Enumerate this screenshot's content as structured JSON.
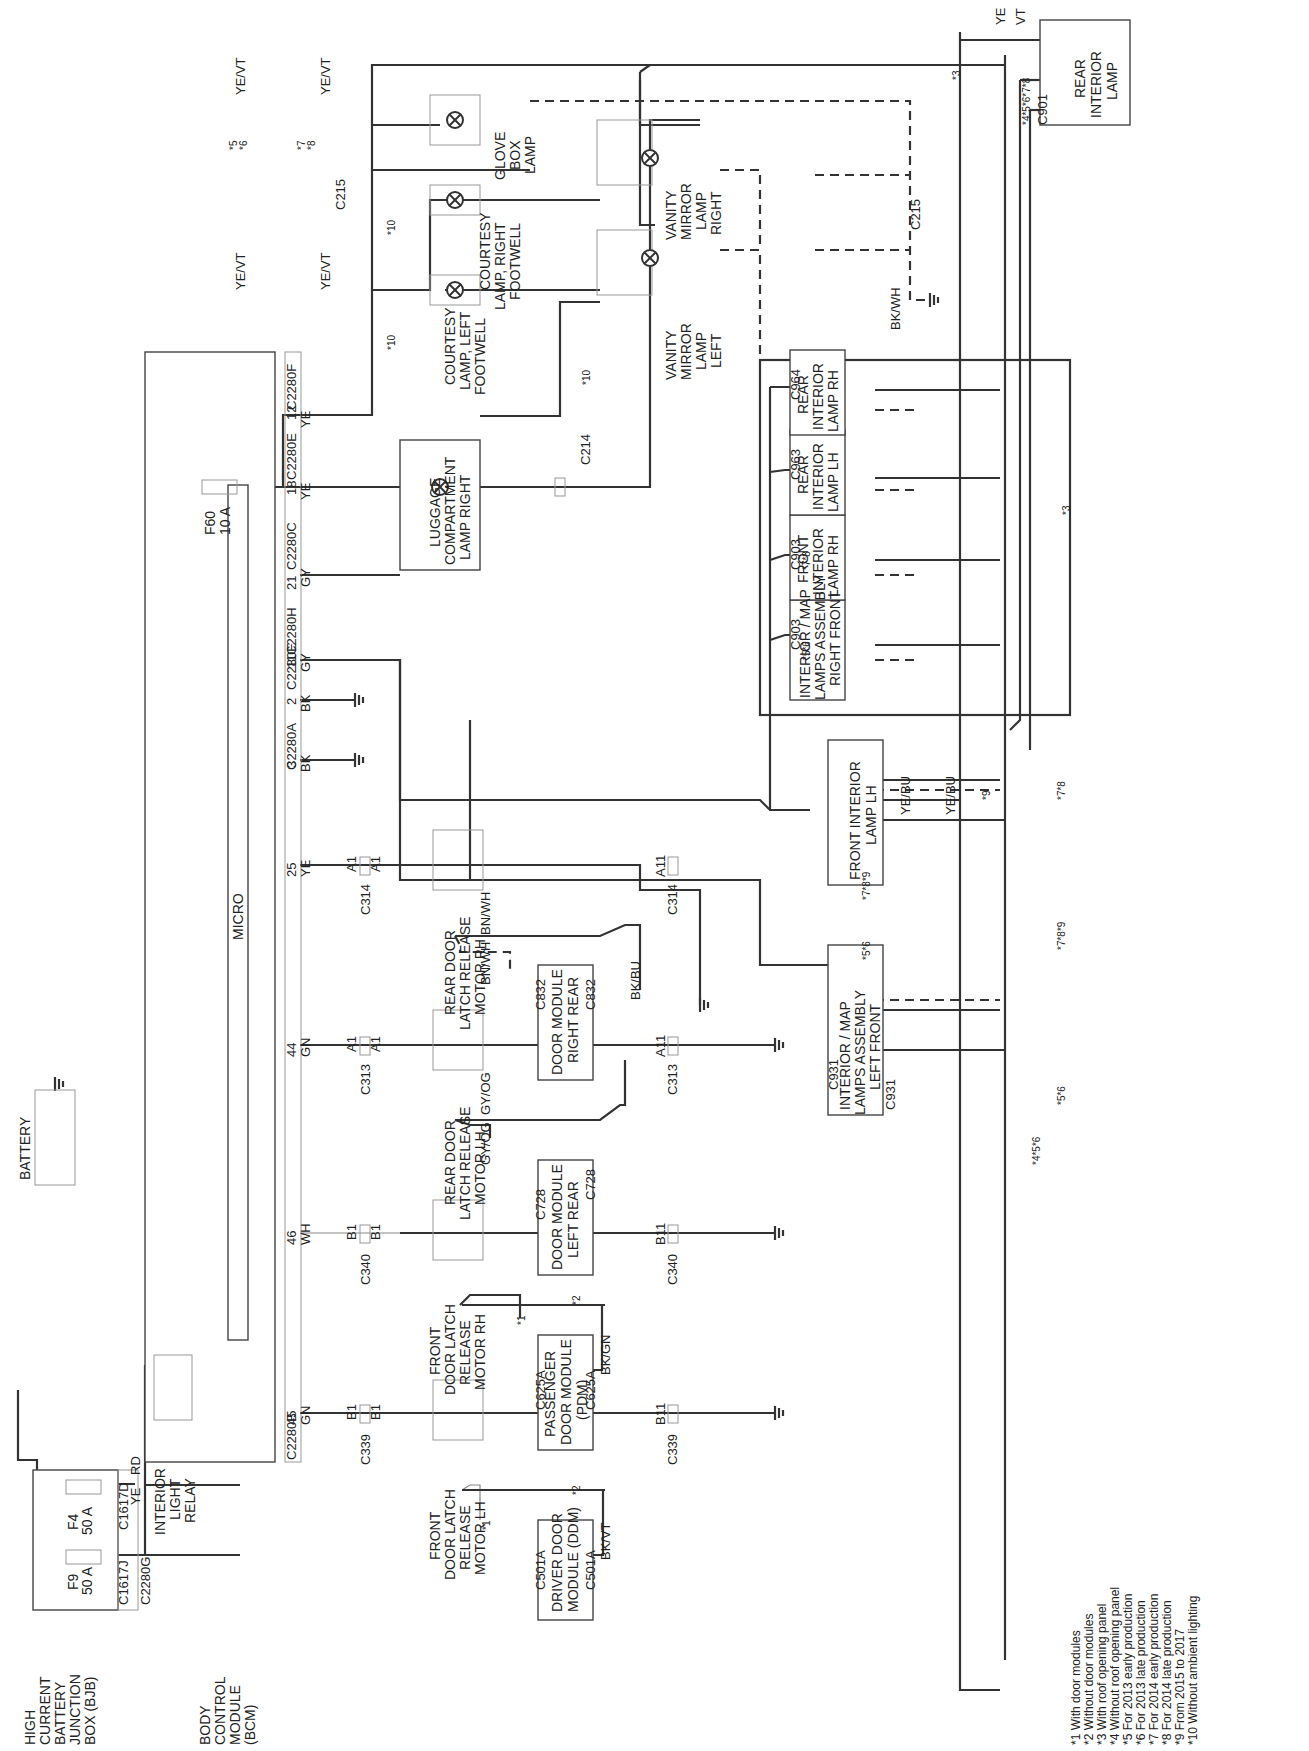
{
  "diagram": {
    "orientation": "rotated-90-ccw",
    "components": {
      "bjb": {
        "label": [
          "HIGH",
          "CURRENT",
          "BATTERY",
          "JUNCTION",
          "BOX (BJB)"
        ],
        "fuses": [
          {
            "id": "F9",
            "rating": "50 A",
            "connector": "C1617J",
            "pin": "1"
          },
          {
            "id": "F4",
            "rating": "50 A",
            "connector": "C1617D",
            "pin": "1"
          }
        ]
      },
      "battery": {
        "label": "BATTERY"
      },
      "bcm": {
        "label": [
          "BODY",
          "CONTROL",
          "MODULE",
          "(BCM)"
        ],
        "micro_label": "MICRO",
        "fuse": {
          "id": "F60",
          "rating": "10 A"
        }
      },
      "relay": {
        "label": [
          "INTERIOR",
          "LIGHT",
          "RELAY"
        ]
      },
      "front_latch_lh": {
        "label": [
          "FRONT",
          "DOOR LATCH",
          "RELEASE",
          "MOTOR LH"
        ]
      },
      "front_latch_rh": {
        "label": [
          "FRONT",
          "DOOR LATCH",
          "RELEASE",
          "MOTOR RH"
        ]
      },
      "rear_latch_lh": {
        "label": [
          "REAR DOOR",
          "LATCH RELEASE",
          "MOTOR LH"
        ]
      },
      "rear_latch_rh": {
        "label": [
          "REAR DOOR",
          "LATCH RELEASE",
          "MOTOR RH"
        ]
      },
      "ddm": {
        "label": [
          "DRIVER DOOR",
          "MODULE (DDM)"
        ]
      },
      "pdm": {
        "label": [
          "PASSENGER",
          "DOOR MODULE",
          "(PDM)"
        ]
      },
      "dm_left_rear": {
        "label": [
          "DOOR MODULE",
          "LEFT REAR"
        ]
      },
      "dm_right_rear": {
        "label": [
          "DOOR MODULE",
          "RIGHT REAR"
        ]
      },
      "luggage_lamp": {
        "label": [
          "LUGGAGE",
          "COMPARTMENT",
          "LAMP RIGHT"
        ]
      },
      "courtesy_left": {
        "label": [
          "COURTESY",
          "LAMP, LEFT",
          "FOOTWELL"
        ]
      },
      "courtesy_right": {
        "label": [
          "COURTESY",
          "LAMP, RIGHT",
          "FOOTWELL"
        ]
      },
      "glove_box": {
        "label": [
          "GLOVE",
          "BOX",
          "LAMP"
        ]
      },
      "vanity_left": {
        "label": [
          "VANITY",
          "MIRROR",
          "LAMP",
          "LEFT"
        ]
      },
      "vanity_right": {
        "label": [
          "VANITY",
          "MIRROR",
          "LAMP",
          "RIGHT"
        ]
      },
      "map_left_front": {
        "label": [
          "INTERIOR / MAP",
          "LAMPS ASSEMBLY",
          "LEFT FRONT"
        ]
      },
      "map_right_front": {
        "label": [
          "INTERIOR / MAP",
          "LAMPS ASSEMBLY",
          "RIGHT FRONT"
        ]
      },
      "front_int_lh": {
        "label": [
          "FRONT INTERIOR",
          "LAMP LH"
        ]
      },
      "front_int_rh": {
        "label": [
          "FRONT",
          "INTERIOR",
          "LAMP RH"
        ]
      },
      "rear_int_lh": {
        "label": [
          "REAR",
          "INTERIOR",
          "LAMP LH"
        ]
      },
      "rear_int_rh": {
        "label": [
          "REAR",
          "INTERIOR",
          "LAMP RH"
        ]
      },
      "rear_int": {
        "label": [
          "REAR",
          "INTERIOR",
          "LAMP"
        ]
      }
    },
    "connectors": {
      "c2280g": "C2280G",
      "c2280b": "C2280B",
      "c2280a": "C2280A",
      "c2280e": "C2280E",
      "c2280h": "C2280H",
      "c2280c": "C2280C",
      "c2280e2": "C2280E",
      "c2280f": "C2280F",
      "c339": "C339",
      "c340": "C340",
      "c313": "C313",
      "c314": "C314",
      "c214": "C214",
      "c215": "C215",
      "c501a": "C501A",
      "c625a": "C625A",
      "c728": "C728",
      "c832": "C832",
      "c931": "C931",
      "c903": "C903",
      "c963": "C963",
      "c964": "C964",
      "c901": "C901",
      "c215_c237": [
        "*5 C215",
        "*6 C237"
      ],
      "c215_c237_b": [
        "*5C215",
        "*6C237"
      ]
    },
    "bcm_pins": [
      "1",
      "2",
      "45",
      "46",
      "44",
      "25",
      "3",
      "2",
      "11",
      "21",
      "18",
      "12"
    ],
    "wire_colors": {
      "ye": "YE",
      "rd": "RD",
      "gn_vt": [
        "GN",
        "/",
        "VT"
      ],
      "wh": "WH",
      "gn": "GN",
      "bk_gy": [
        "BK",
        "/",
        "GY"
      ],
      "gy_vt": [
        "GY",
        "/",
        "VT"
      ],
      "ye_vt": [
        "YE",
        "/",
        "VT"
      ],
      "bk_vt": [
        "BK",
        "/",
        "VT"
      ],
      "bk_gn": [
        "BK",
        "/",
        "GN"
      ],
      "bk_bu": [
        "BK",
        "/",
        "BU"
      ],
      "bk_wh": [
        "BK",
        "/",
        "WH"
      ],
      "gy_og": [
        "GY",
        "/",
        "OG"
      ],
      "ye_bu": [
        "YE",
        "/",
        "BU"
      ],
      "yevt": "YE/VT",
      "ye_bu_inline": "YE/BU",
      "bkbu": "BK/BU",
      "bkwh": "BK/WH",
      "gyog": "GY/OG",
      "bnwh": "BN/WH",
      "bkgn": "BK/GN",
      "bkvt": "BK/VT"
    },
    "pins": {
      "b1": "B1",
      "b11": "B11",
      "a1": "A1",
      "a11": "A11",
      "p3": "3",
      "p4": "4",
      "p5": "5",
      "p6": "6",
      "p13": "13",
      "p14": "14",
      "p39": "39",
      "p10": "10",
      "p11": "11",
      "p1": "1",
      "p2": "2",
      "p1016": "1016"
    },
    "option_tags": {
      "o1": "*1",
      "o2": "*2",
      "o3": "*3",
      "o10": "*10",
      "o56": "*5*6",
      "o78": "*7*8",
      "o789": "*7*8*9",
      "o4567_8": "*4*5*6*7*8",
      "o456": "*4*5*6",
      "o9": "*9",
      "o5": "*5",
      "o6": "*6",
      "o7": "*7",
      "o8": "*8",
      "o511": "*511",
      "o610": "*610",
      "o9c931": "*9C931",
      "o78c931": "*7*8C931"
    },
    "legend": [
      "*1 With door modules",
      "*2 Without door modules",
      "*3 With roof opening panel",
      "*4 Without roof opening panel",
      "*5 For 2013 early production",
      "*6 For 2013 late production",
      "*7 For 2014 early production",
      "*8 For 2014 late production",
      "*9 From 2015 to 2017",
      "*10 Without ambient lighting"
    ]
  }
}
